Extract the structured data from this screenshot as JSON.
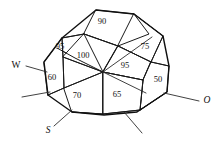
{
  "figure": {
    "type": "technical-line-drawing",
    "background_color": "#ffffff",
    "line_color": "#1a1a1a"
  },
  "facet_values": [
    {
      "id": "facet-top",
      "label": "90",
      "x": 102,
      "y": 22
    },
    {
      "id": "facet-upper-left",
      "label": "95",
      "x": 60,
      "y": 47
    },
    {
      "id": "facet-center-upper",
      "label": "100",
      "x": 83,
      "y": 56
    },
    {
      "id": "facet-upper-right",
      "label": "75",
      "x": 145,
      "y": 47
    },
    {
      "id": "facet-center-right",
      "label": "95",
      "x": 125,
      "y": 66
    },
    {
      "id": "facet-left",
      "label": "60",
      "x": 52,
      "y": 78
    },
    {
      "id": "facet-right",
      "label": "50",
      "x": 158,
      "y": 80
    },
    {
      "id": "facet-lower-left",
      "label": "70",
      "x": 77,
      "y": 96
    },
    {
      "id": "facet-lower-center",
      "label": "65",
      "x": 117,
      "y": 95
    }
  ],
  "direction_labels": [
    {
      "id": "direction-west",
      "label": "W",
      "x": 16,
      "y": 66,
      "italic": false
    },
    {
      "id": "direction-south",
      "label": "S",
      "x": 48,
      "y": 131,
      "italic": true
    },
    {
      "id": "direction-ost",
      "label": "O",
      "x": 207,
      "y": 101,
      "italic": true
    }
  ],
  "geometry": {
    "center_vertex": {
      "x": 103,
      "y": 72
    },
    "outline_points": "62,38 96,10 134,14 163,36 169,66 167,92 137,112 104,115 72,112 48,95 44,62",
    "facets": [
      {
        "id": "facet-top-shape",
        "points": "96,10 134,14 149,34 118,46 84,34"
      },
      {
        "id": "facet-upper-left-shape",
        "points": "62,38 84,34 103,72 75,58 57,48"
      },
      {
        "id": "facet-center-upper-shape",
        "points": "84,34 118,46 103,72 63,57"
      },
      {
        "id": "facet-upper-right-shape",
        "points": "134,14 163,36 151,62 118,46"
      },
      {
        "id": "facet-center-right-shape",
        "points": "118,46 151,62 143,80 103,72"
      },
      {
        "id": "facet-left-shape",
        "points": "44,62 62,38 63,57 64,88 48,95"
      },
      {
        "id": "facet-right-shape",
        "points": "151,62 169,66 167,92 140,110 143,80"
      },
      {
        "id": "facet-lower-left-shape",
        "points": "64,88 103,72 103,114 72,112"
      },
      {
        "id": "facet-lower-center-shape",
        "points": "103,72 143,80 140,110 103,114"
      }
    ],
    "interior_edges": [
      "M 84,34 L 103,72",
      "M 118,46 L 103,72",
      "M 143,80 L 103,72",
      "M 64,88 L 103,72",
      "M 63,57 L 103,72",
      "M 103,72 L 103,114",
      "M 84,34 L 118,46",
      "M 118,46 L 151,62",
      "M 143,80 L 151,62",
      "M 62,38 L 84,34",
      "M 62,38 L 63,57",
      "M 63,57 L 64,88",
      "M 134,14 L 149,34 L 118,46",
      "M 163,36 L 151,62",
      "M 169,66 L 151,62",
      "M 167,92 L 140,110",
      "M 140,110 L 143,80",
      "M 103,114 L 140,110",
      "M 72,112 L 103,114",
      "M 48,95 L 64,88",
      "M 57,48 L 75,58 L 103,72"
    ],
    "leader_lines": [
      {
        "id": "leader-west",
        "path": "M 26,66 L 47,72"
      },
      {
        "id": "leader-west-lower",
        "path": "M 22,97 L 50,92"
      },
      {
        "id": "leader-south",
        "path": "M 54,126 L 72,110"
      },
      {
        "id": "leader-bottom-mid",
        "path": "M 124,112 L 142,133"
      },
      {
        "id": "leader-ost",
        "path": "M 199,101 L 164,93"
      },
      {
        "id": "leader-center-right",
        "path": "M 103,72 L 146,93"
      },
      {
        "id": "leader-center-to-75",
        "path": "M 103,72 L 152,37"
      }
    ]
  }
}
